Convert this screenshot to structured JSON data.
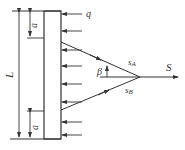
{
  "diagram": {
    "labels": {
      "length": "L",
      "offset_top": "a",
      "offset_bottom": "a",
      "load": "q",
      "angle": "β",
      "force_a": "s",
      "force_a_sub": "A",
      "force_b": "s",
      "force_b_sub": "B",
      "resultant": "S"
    },
    "colors": {
      "line": "#333333",
      "background": "#ffffff"
    },
    "load_arrow_count": 8
  }
}
